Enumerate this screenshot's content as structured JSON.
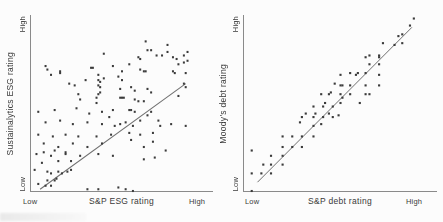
{
  "figure": {
    "background": "#fcfcfc",
    "point_color": "#3b3b3b",
    "axis_color": "#8a8a8a",
    "trendline_color": "#6f6f6f",
    "text_color": "#3a3a3a"
  },
  "chart_data": [
    {
      "type": "scatter",
      "title": "",
      "xlabel": "S&P ESG rating",
      "ylabel": "Sustainalytics ESG rating",
      "x_tick_labels": [
        "Low",
        "High"
      ],
      "y_tick_labels": [
        "Low",
        "High"
      ],
      "axis_range": [
        0,
        100
      ],
      "grid": false,
      "legend": false,
      "trendline": {
        "x1": 5,
        "y1": 1,
        "x2": 85,
        "y2": 61
      },
      "points": [
        [
          63,
          85
        ],
        [
          64,
          80
        ],
        [
          66,
          80
        ],
        [
          75,
          83
        ],
        [
          75,
          79
        ],
        [
          69,
          77
        ],
        [
          72,
          77
        ],
        [
          78,
          76
        ],
        [
          80,
          75
        ],
        [
          84,
          77
        ],
        [
          84,
          73
        ],
        [
          60,
          75
        ],
        [
          59,
          76
        ],
        [
          40,
          78
        ],
        [
          86,
          79
        ],
        [
          86,
          74
        ],
        [
          8,
          71
        ],
        [
          9,
          69
        ],
        [
          11,
          66
        ],
        [
          16,
          68
        ],
        [
          21,
          61
        ],
        [
          24,
          60
        ],
        [
          30,
          63
        ],
        [
          34,
          70
        ],
        [
          37,
          66
        ],
        [
          37,
          63
        ],
        [
          37,
          60
        ],
        [
          26,
          55
        ],
        [
          27,
          52
        ],
        [
          37,
          55
        ],
        [
          33,
          70
        ],
        [
          16,
          67
        ],
        [
          38,
          62
        ],
        [
          38,
          59
        ],
        [
          38,
          56
        ],
        [
          36,
          53
        ],
        [
          36,
          50
        ],
        [
          45,
          71
        ],
        [
          50,
          68
        ],
        [
          54,
          72
        ],
        [
          60,
          69
        ],
        [
          62,
          68
        ],
        [
          63,
          68
        ],
        [
          78,
          68
        ],
        [
          79,
          67
        ],
        [
          85,
          67
        ],
        [
          84,
          61
        ],
        [
          85,
          59
        ],
        [
          81,
          54
        ],
        [
          40,
          64
        ],
        [
          48,
          65
        ],
        [
          50,
          63
        ],
        [
          49,
          58
        ],
        [
          55,
          59
        ],
        [
          57,
          57
        ],
        [
          64,
          58
        ],
        [
          66,
          56
        ],
        [
          49,
          53
        ],
        [
          50,
          53
        ],
        [
          51,
          53
        ],
        [
          57,
          52
        ],
        [
          59,
          51
        ],
        [
          62,
          51
        ],
        [
          54,
          46
        ],
        [
          57,
          45
        ],
        [
          45,
          46
        ],
        [
          43,
          42
        ],
        [
          49,
          38
        ],
        [
          56,
          37
        ],
        [
          81,
          72
        ],
        [
          4,
          45
        ],
        [
          13,
          46
        ],
        [
          25,
          47
        ],
        [
          32,
          44
        ],
        [
          39,
          45
        ],
        [
          8,
          39
        ],
        [
          16,
          40
        ],
        [
          23,
          38
        ],
        [
          31,
          39
        ],
        [
          39,
          38
        ],
        [
          46,
          37
        ],
        [
          4,
          32
        ],
        [
          12,
          31
        ],
        [
          19,
          32
        ],
        [
          26,
          31
        ],
        [
          36,
          31
        ],
        [
          44,
          32
        ],
        [
          7,
          27
        ],
        [
          15,
          25
        ],
        [
          23,
          27
        ],
        [
          31,
          25
        ],
        [
          39,
          27
        ],
        [
          3,
          21
        ],
        [
          11,
          20
        ],
        [
          19,
          21
        ],
        [
          27,
          20
        ],
        [
          37,
          21
        ],
        [
          45,
          20
        ],
        [
          52,
          39
        ],
        [
          55,
          46
        ],
        [
          66,
          45
        ],
        [
          60,
          40
        ],
        [
          64,
          43
        ],
        [
          70,
          40
        ],
        [
          7,
          22
        ],
        [
          13,
          23
        ],
        [
          19,
          22
        ],
        [
          6,
          16
        ],
        [
          15,
          17
        ],
        [
          22,
          17
        ],
        [
          2,
          12
        ],
        [
          9,
          11
        ],
        [
          11,
          10
        ],
        [
          15,
          11
        ],
        [
          17,
          10
        ],
        [
          20,
          11
        ],
        [
          22,
          12
        ],
        [
          9,
          6
        ],
        [
          13,
          6
        ],
        [
          14,
          7
        ],
        [
          4,
          4
        ],
        [
          8,
          3
        ],
        [
          11,
          3
        ],
        [
          71,
          37
        ],
        [
          77,
          38
        ],
        [
          67,
          33
        ],
        [
          60,
          32
        ],
        [
          54,
          33
        ],
        [
          55,
          29
        ],
        [
          62,
          25
        ],
        [
          67,
          28
        ],
        [
          74,
          23
        ],
        [
          68,
          19
        ],
        [
          62,
          18
        ],
        [
          85,
          37
        ],
        [
          56,
          0
        ],
        [
          31,
          1
        ],
        [
          37,
          1
        ],
        [
          48,
          2
        ],
        [
          52,
          1
        ]
      ]
    },
    {
      "type": "scatter",
      "title": "",
      "xlabel": "S&P debt rating",
      "ylabel": "Moody's debt rating",
      "x_tick_labels": [
        "Low",
        "High"
      ],
      "y_tick_labels": [
        "Low",
        "High"
      ],
      "axis_range": [
        0,
        100
      ],
      "grid": false,
      "legend": false,
      "trendline": {
        "x1": 7,
        "y1": 5,
        "x2": 87,
        "y2": 93
      },
      "points": [
        [
          4,
          23
        ],
        [
          4,
          10
        ],
        [
          9,
          10
        ],
        [
          10,
          15
        ],
        [
          14,
          20
        ],
        [
          14,
          15
        ],
        [
          14,
          10
        ],
        [
          20,
          31
        ],
        [
          20,
          25
        ],
        [
          20,
          20
        ],
        [
          20,
          15
        ],
        [
          25,
          31
        ],
        [
          25,
          25
        ],
        [
          30,
          42
        ],
        [
          30,
          31
        ],
        [
          30,
          25
        ],
        [
          36,
          48
        ],
        [
          36,
          42
        ],
        [
          36,
          37
        ],
        [
          36,
          31
        ],
        [
          41,
          48
        ],
        [
          41,
          42
        ],
        [
          46,
          48
        ],
        [
          46,
          42
        ],
        [
          51,
          53
        ],
        [
          63,
          76
        ],
        [
          70,
          76
        ],
        [
          65,
          72
        ],
        [
          50,
          66
        ],
        [
          58,
          66
        ],
        [
          63,
          67
        ],
        [
          70,
          66
        ],
        [
          50,
          60
        ],
        [
          55,
          60
        ],
        [
          63,
          60
        ],
        [
          70,
          60
        ],
        [
          40,
          55
        ],
        [
          44,
          55
        ],
        [
          50,
          55
        ],
        [
          55,
          55
        ],
        [
          63,
          55
        ],
        [
          42,
          50
        ],
        [
          50,
          50
        ],
        [
          60,
          50
        ],
        [
          32,
          44
        ],
        [
          37,
          44
        ],
        [
          44,
          44
        ],
        [
          49,
          43
        ],
        [
          29,
          39
        ],
        [
          40,
          38
        ],
        [
          47,
          61
        ],
        [
          51,
          60
        ],
        [
          45,
          56
        ],
        [
          65,
          55
        ],
        [
          55,
          67
        ],
        [
          59,
          67
        ],
        [
          65,
          77
        ],
        [
          70,
          77
        ],
        [
          70,
          72
        ],
        [
          72,
          84
        ],
        [
          78,
          83
        ],
        [
          82,
          84
        ],
        [
          82,
          89
        ],
        [
          86,
          94
        ],
        [
          88,
          98
        ],
        [
          80,
          88
        ],
        [
          4,
          0
        ]
      ]
    }
  ]
}
